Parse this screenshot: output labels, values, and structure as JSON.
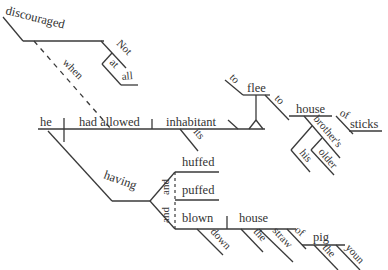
{
  "diagram": {
    "type": "sentence-diagram",
    "colors": {
      "line": "#3a3a3a",
      "text": "#333333",
      "background": "#ffffff"
    },
    "words": {
      "discouraged": "discouraged",
      "not": "Not",
      "at": "at",
      "all": "all",
      "when": "when",
      "he": "he",
      "had_allowed": "had allowed",
      "inhabitant": "inhabitant",
      "its": "its",
      "to1": "to",
      "flee": "flee",
      "to2": "to",
      "house1": "house",
      "of1": "of",
      "sticks": "sticks",
      "brothers": "brother's",
      "his": "his",
      "older": "older",
      "having": "having",
      "huffed": "huffed",
      "puffed": "puffed",
      "and1": "and",
      "and2": "and",
      "blown": "blown",
      "down": "down",
      "house2": "house",
      "the1": "the",
      "straw": "straw",
      "of2": "of",
      "pig": "pig",
      "the2": "the",
      "young": "youn"
    }
  }
}
